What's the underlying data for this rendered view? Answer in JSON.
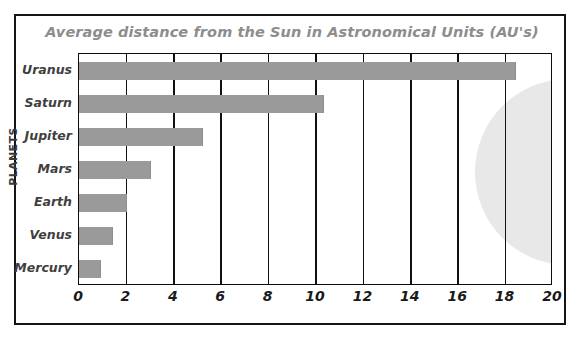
{
  "chart_data": {
    "type": "bar",
    "orientation": "horizontal",
    "title": "Average distance from the Sun in Astronomical Units (AU's)",
    "xlabel": "",
    "ylabel": "PLANETS",
    "categories": [
      "Mercury",
      "Venus",
      "Earth",
      "Mars",
      "Jupiter",
      "Saturn",
      "Uranus"
    ],
    "values": [
      0.9,
      1.4,
      2.0,
      3.0,
      5.2,
      10.3,
      18.4
    ],
    "xlim": [
      0,
      20
    ],
    "xticks": [
      0,
      2,
      4,
      6,
      8,
      10,
      12,
      14,
      16,
      18,
      20
    ],
    "xtick_labels": [
      "0",
      "2",
      "4",
      "6",
      "8",
      "10",
      "12",
      "14",
      "16",
      "18",
      "20"
    ],
    "grid": "vertical",
    "legend": "none",
    "bar_color": "#9a9a9a",
    "title_color": "#8d8d8d",
    "gridline_color": "#111111",
    "decoration": {
      "name": "sun-circle",
      "color": "#e8e8e8",
      "shape": "circle"
    }
  }
}
